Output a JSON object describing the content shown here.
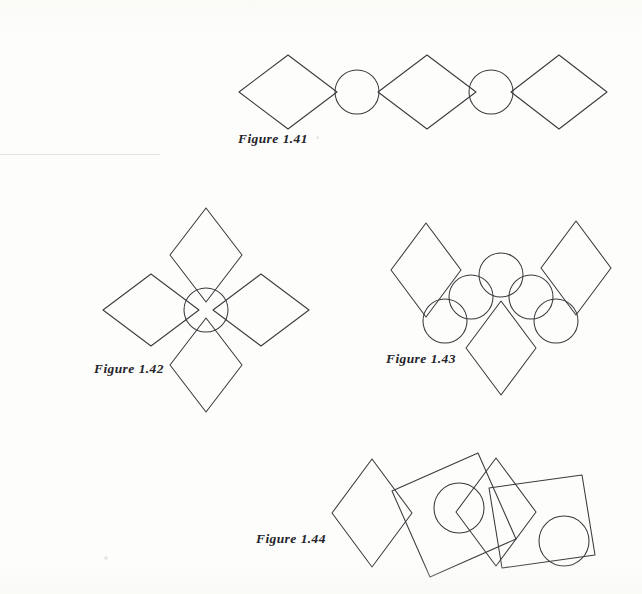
{
  "page": {
    "width": 642,
    "height": 594,
    "background_color": "#fdfdfb",
    "ink_color": "#3a3a3c",
    "caption_color": "#24242a",
    "kind": "scanned-textbook-figure-page"
  },
  "figures": [
    {
      "id": "figure-1-41",
      "caption": "Figure 1.41",
      "caption_label": "Figure",
      "caption_number": "1.41",
      "description": "Horizontal strip: diamond, circle, diamond, circle, diamond alternating and touching vertex to vertex",
      "shape_counts": {
        "diamonds": 3,
        "circles": 2,
        "squares": 0
      },
      "shapes": [
        {
          "type": "diamond",
          "cx": 288,
          "cy": 92,
          "rx": 49,
          "ry": 37,
          "rotation": 0
        },
        {
          "type": "circle",
          "cx": 357,
          "cy": 92,
          "r": 22
        },
        {
          "type": "diamond",
          "cx": 427,
          "cy": 92,
          "rx": 49,
          "ry": 37,
          "rotation": 0
        },
        {
          "type": "circle",
          "cx": 491,
          "cy": 92,
          "r": 22
        },
        {
          "type": "diamond",
          "cx": 559,
          "cy": 92,
          "rx": 48,
          "ry": 37,
          "rotation": 0
        }
      ]
    },
    {
      "id": "figure-1-42",
      "caption": "Figure 1.42",
      "caption_label": "Figure",
      "caption_number": "1.42",
      "description": "Four diamonds arranged around a central circle like flower petals",
      "shape_counts": {
        "diamonds": 4,
        "circles": 1,
        "squares": 0
      },
      "shapes": [
        {
          "type": "circle",
          "cx": 206,
          "cy": 310,
          "r": 22
        },
        {
          "type": "diamond",
          "cx": 206,
          "cy": 255,
          "rx": 36,
          "ry": 48,
          "rotation": 0,
          "position": "top"
        },
        {
          "type": "diamond",
          "cx": 151,
          "cy": 310,
          "rx": 48,
          "ry": 36,
          "rotation": 0,
          "position": "left"
        },
        {
          "type": "diamond",
          "cx": 261,
          "cy": 310,
          "rx": 48,
          "ry": 36,
          "rotation": 0,
          "position": "right"
        },
        {
          "type": "diamond",
          "cx": 206,
          "cy": 365,
          "rx": 36,
          "ry": 48,
          "rotation": 0,
          "position": "bottom"
        }
      ]
    },
    {
      "id": "figure-1-43",
      "caption": "Figure 1.43",
      "caption_label": "Figure",
      "caption_number": "1.43",
      "description": "Three diamonds (upper left, upper right, lower centre) with five circles forming an arc between them",
      "shape_counts": {
        "diamonds": 3,
        "circles": 5,
        "squares": 0
      },
      "shapes": [
        {
          "type": "diamond",
          "cx": 426,
          "cy": 270,
          "rx": 35,
          "ry": 47,
          "rotation": 0,
          "position": "upper-left"
        },
        {
          "type": "diamond",
          "cx": 576,
          "cy": 268,
          "rx": 35,
          "ry": 47,
          "rotation": 0,
          "position": "upper-right"
        },
        {
          "type": "diamond",
          "cx": 501,
          "cy": 348,
          "rx": 35,
          "ry": 47,
          "rotation": 0,
          "position": "lower-centre"
        },
        {
          "type": "circle",
          "cx": 501,
          "cy": 275,
          "r": 22,
          "position": "top"
        },
        {
          "type": "circle",
          "cx": 471,
          "cy": 297,
          "r": 22,
          "position": "mid-left"
        },
        {
          "type": "circle",
          "cx": 531,
          "cy": 297,
          "r": 22,
          "position": "mid-right"
        },
        {
          "type": "circle",
          "cx": 445,
          "cy": 321,
          "r": 22,
          "position": "lower-left"
        },
        {
          "type": "circle",
          "cx": 556,
          "cy": 321,
          "r": 22,
          "position": "lower-right"
        }
      ]
    },
    {
      "id": "figure-1-44",
      "caption": "Figure 1.44",
      "caption_label": "Figure",
      "caption_number": "1.44",
      "description": "Irregular horizontal chain of four overlapping tilted squares/diamonds with two circles tucked between them",
      "shape_counts": {
        "diamonds": 2,
        "circles": 2,
        "squares": 2
      },
      "shapes": [
        {
          "type": "diamond",
          "cx": 372,
          "cy": 513,
          "rx": 40,
          "ry": 54,
          "rotation": 0,
          "position": "first"
        },
        {
          "type": "square",
          "cx": 434,
          "cy": 519,
          "half": 47,
          "rotation": -24,
          "position": "second"
        },
        {
          "type": "circle",
          "cx": 459,
          "cy": 508,
          "r": 25,
          "position": "upper"
        },
        {
          "type": "diamond",
          "cx": 496,
          "cy": 512,
          "rx": 40,
          "ry": 54,
          "rotation": 0,
          "position": "third"
        },
        {
          "type": "square",
          "cx": 542,
          "cy": 515,
          "half": 47,
          "rotation": -8,
          "position": "fourth"
        },
        {
          "type": "circle",
          "cx": 564,
          "cy": 541,
          "r": 25,
          "position": "lower"
        }
      ]
    }
  ]
}
